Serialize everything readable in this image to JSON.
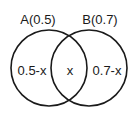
{
  "diagram": {
    "type": "venn",
    "sets": [
      {
        "name": "A",
        "label": "A(0.5)",
        "region_label": "0.5-x"
      },
      {
        "name": "B",
        "label": "B(0.7)",
        "region_label": "0.7-x"
      }
    ],
    "intersection_label": "x",
    "stroke_color": "#1a1a1a",
    "background": "#ffffff"
  }
}
